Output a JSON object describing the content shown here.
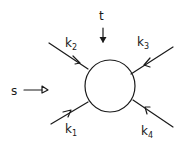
{
  "diagram": {
    "type": "feynman-one-loop-four-point",
    "loop": {
      "shape": "circle",
      "cx": 110,
      "cy": 86,
      "r": 25
    },
    "channels": {
      "s": {
        "label": "s",
        "arrow": "right"
      },
      "t": {
        "label": "t",
        "arrow": "down"
      }
    },
    "legs": [
      {
        "id": "k1",
        "label": "k",
        "sub": "1",
        "position": "lower-left",
        "direction": "incoming"
      },
      {
        "id": "k2",
        "label": "k",
        "sub": "2",
        "position": "upper-left",
        "direction": "incoming"
      },
      {
        "id": "k3",
        "label": "k",
        "sub": "3",
        "position": "upper-right",
        "direction": "incoming"
      },
      {
        "id": "k4",
        "label": "k",
        "sub": "4",
        "position": "lower-right",
        "direction": "incoming"
      }
    ],
    "colors": {
      "ink": "#1a1a1a",
      "background": "#ffffff"
    }
  }
}
